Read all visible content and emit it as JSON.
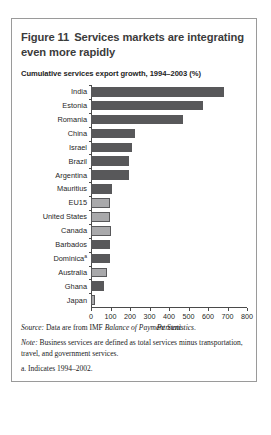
{
  "figure": {
    "number_label": "Figure 11",
    "title": "Services markets are integrating even more rapidly",
    "subtitle": "Cumulative services export growth, 1994–2003 (%)"
  },
  "notes": {
    "source_lead": "Source:",
    "source_text_a": " Data are from IMF ",
    "source_text_em": "Balance of Payment Statistics",
    "source_text_b": ".",
    "note_lead": "Note:",
    "note_text": " Business services are defined as total services minus transportation, travel, and government services.",
    "footnote_a": "a. Indicates 1994–2002."
  },
  "colors": {
    "bar_dark": "#58585a",
    "bar_light": "#a9a9ab",
    "axis": "#4a4a4a",
    "frame": "#9a9a9a",
    "title_text": "#3b3b3b"
  },
  "chart_data": {
    "type": "bar",
    "orientation": "horizontal",
    "title": "Cumulative services export growth, 1994–2003 (%)",
    "xlabel": "Percent",
    "ylabel": "",
    "xlim": [
      0,
      800
    ],
    "xticks": [
      0,
      100,
      200,
      300,
      400,
      500,
      600,
      700,
      800
    ],
    "xticklabels": [
      "0",
      "100",
      "200",
      "300",
      "400",
      "500",
      "600",
      "700",
      "800"
    ],
    "grid": false,
    "legend": null,
    "categories": [
      "India",
      "Estonia",
      "Romania",
      "China",
      "Israel",
      "Brazil",
      "Argentina",
      "Mauritius",
      "EU15",
      "United States",
      "Canada",
      "Barbados",
      "Dominica",
      "Australia",
      "Ghana",
      "Japan"
    ],
    "category_footnotes": {
      "Dominica": "a"
    },
    "values": [
      682,
      575,
      470,
      228,
      208,
      196,
      193,
      108,
      97,
      96,
      101,
      97,
      96,
      82,
      67,
      22
    ],
    "bar_shades": [
      "dark",
      "dark",
      "dark",
      "dark",
      "dark",
      "dark",
      "dark",
      "dark",
      "light",
      "light",
      "light",
      "dark",
      "dark",
      "light",
      "dark",
      "light"
    ]
  }
}
